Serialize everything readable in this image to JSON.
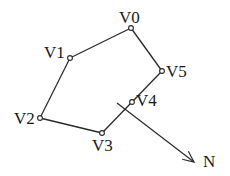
{
  "diagram": {
    "title": "",
    "vertices": [
      {
        "id": "V0",
        "label": "V0",
        "x": 131,
        "y": 28,
        "label_x": 119,
        "label_y": 23
      },
      {
        "id": "V1",
        "label": "V1",
        "x": 70,
        "y": 58,
        "label_x": 44,
        "label_y": 58
      },
      {
        "id": "V2",
        "label": "V2",
        "x": 40,
        "y": 118,
        "label_x": 14,
        "label_y": 124
      },
      {
        "id": "V3",
        "label": "V3",
        "x": 102,
        "y": 133,
        "label_x": 92,
        "label_y": 151
      },
      {
        "id": "V4",
        "label": "V4",
        "x": 132,
        "y": 102,
        "label_x": 136,
        "label_y": 106
      },
      {
        "id": "V5",
        "label": "V5",
        "x": 162,
        "y": 71,
        "label_x": 166,
        "label_y": 77
      }
    ],
    "edges": [
      [
        "V0",
        "V1"
      ],
      [
        "V1",
        "V2"
      ],
      [
        "V2",
        "V3"
      ],
      [
        "V3",
        "V4"
      ],
      [
        "V4",
        "V5"
      ],
      [
        "V5",
        "V0"
      ]
    ],
    "normal": {
      "label": "N",
      "start": {
        "x": 117,
        "y": 103
      },
      "end": {
        "x": 194,
        "y": 162
      },
      "label_x": 203,
      "label_y": 167
    },
    "colors": {
      "stroke": "#2a2a2a",
      "text": "#1a1a1a",
      "background": "#ffffff"
    }
  }
}
